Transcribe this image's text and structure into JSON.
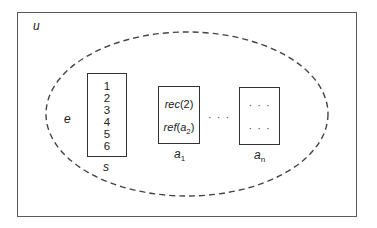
{
  "diagram": {
    "universe_label": "u",
    "environment_label": "e",
    "store": {
      "label": "s",
      "values": [
        "1",
        "2",
        "3",
        "4",
        "5",
        "6"
      ]
    },
    "records": [
      {
        "label_base": "a",
        "label_sub": "1",
        "entries": [
          {
            "fn": "rec",
            "arg": "(2)"
          },
          {
            "fn": "ref",
            "arg_open": "(",
            "arg_base": "a",
            "arg_sub": "2",
            "arg_close": ")"
          }
        ]
      },
      {
        "label_base": "a",
        "label_sub": "n",
        "entries": [
          {
            "text": "· · ·"
          },
          {
            "text": "· · ·"
          }
        ]
      }
    ],
    "between_ellipsis": "· · ·",
    "colors": {
      "frame": "#5a5a5a",
      "ellipse_stroke": "#444444",
      "box_stroke": "#333333",
      "text": "#222222"
    }
  }
}
